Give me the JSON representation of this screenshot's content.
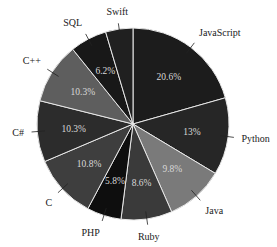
{
  "chart_data": {
    "type": "pie",
    "title": "",
    "start_angle_deg": 0,
    "direction": "clockwise",
    "categories": [
      "JavaScript",
      "Python",
      "Java",
      "Ruby",
      "PHP",
      "C",
      "C#",
      "C++",
      "SQL",
      "Swift"
    ],
    "values": [
      20.6,
      13,
      9.8,
      8.6,
      5.8,
      10.8,
      10.3,
      10.3,
      6.2,
      4.6
    ],
    "value_labels": [
      "20.6%",
      "13%",
      "9.8%",
      "8.6%",
      "5.8%",
      "10.8%",
      "10.3%",
      "10.3%",
      "6.2%",
      ""
    ],
    "colors": [
      "#1c1c1c",
      "#262626",
      "#7a7a7a",
      "#3a3a3a",
      "#0e0e0e",
      "#3e3e3e",
      "#2c2c2c",
      "#5e5e5e",
      "#181818",
      "#202020"
    ],
    "legend": "none",
    "labels_outside_with_leaders": true
  }
}
